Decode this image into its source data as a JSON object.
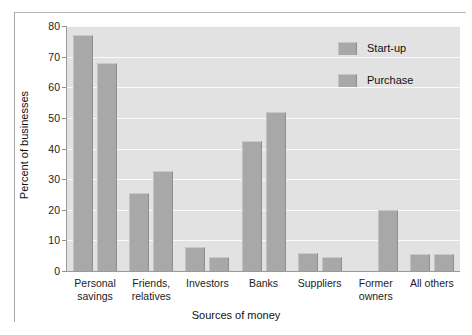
{
  "chart_data": {
    "type": "bar",
    "title": "",
    "xlabel": "Sources of money",
    "ylabel": "Percent of businesses",
    "ylim": [
      0,
      80
    ],
    "yticks": [
      0,
      10,
      20,
      30,
      40,
      50,
      60,
      70,
      80
    ],
    "grid": true,
    "legend_position": "top-right",
    "categories": [
      "Personal\nsavings",
      "Friends,\nrelatives",
      "Investors",
      "Banks",
      "Suppliers",
      "Former\nowners",
      "All others"
    ],
    "series": [
      {
        "name": "Start-up",
        "values": [
          77,
          25.5,
          8,
          42.5,
          6,
          0,
          5.5
        ]
      },
      {
        "name": "Purchase",
        "values": [
          68,
          32.5,
          4.5,
          52,
          4.5,
          20,
          5.5
        ]
      }
    ]
  },
  "colors": {
    "bar": "#a8a8a8",
    "bar_highlight": "#c9c9c9",
    "bar_shadow": "#8e8e8e",
    "plot_background": "#e2e2e2",
    "gridline": "#fbfbfb",
    "axis": "#9a9a9a",
    "text": "#1c1c1c",
    "frame": "#b4b4b4"
  }
}
